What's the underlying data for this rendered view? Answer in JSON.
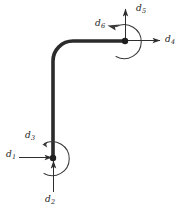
{
  "figure": {
    "background_color": "#ffffff",
    "member_color": "#2b2b2b",
    "annotation_color": "#333333",
    "label_color": "#222222",
    "member_stroke_width": 3.6,
    "annotation_stroke_width": 1.0,
    "node_radius": 3.2
  },
  "geometry": {
    "lower_node": {
      "x": 53,
      "y": 158
    },
    "upper_node": {
      "x": 125,
      "y": 41
    },
    "elbow_corner": {
      "x": 53,
      "y": 41
    },
    "elbow_radius": 20,
    "vertical_segment": {
      "x": 53,
      "y_top": 61,
      "y_bottom": 158
    },
    "horizontal_segment": {
      "y": 41,
      "x_left": 73,
      "x_right": 125
    }
  },
  "labels": {
    "d1": {
      "base": "d",
      "sub": "1",
      "x": 6,
      "y": 154
    },
    "d2": {
      "base": "d",
      "sub": "2",
      "x": 45,
      "y": 197
    },
    "d3": {
      "base": "d",
      "sub": "3",
      "x": 25,
      "y": 135
    },
    "d4": {
      "base": "d",
      "sub": "4",
      "x": 166,
      "y": 38
    },
    "d5": {
      "base": "d",
      "sub": "5",
      "x": 137,
      "y": 6
    },
    "d6": {
      "base": "d",
      "sub": "6",
      "x": 96,
      "y": 22
    }
  },
  "dofs": [
    {
      "id": "d1",
      "label": "d1",
      "node": "lower",
      "type": "translation",
      "direction": "right",
      "description": "horizontal translation at lower node"
    },
    {
      "id": "d2",
      "label": "d2",
      "node": "lower",
      "type": "translation",
      "direction": "up",
      "description": "vertical translation at lower node"
    },
    {
      "id": "d3",
      "label": "d3",
      "node": "lower",
      "type": "rotation",
      "direction": "counterclockwise",
      "description": "rotation at lower node"
    },
    {
      "id": "d4",
      "label": "d4",
      "node": "upper",
      "type": "translation",
      "direction": "right",
      "description": "horizontal translation at upper node"
    },
    {
      "id": "d5",
      "label": "d5",
      "node": "upper",
      "type": "translation",
      "direction": "up",
      "description": "vertical translation at upper node"
    },
    {
      "id": "d6",
      "label": "d6",
      "node": "upper",
      "type": "rotation",
      "direction": "counterclockwise",
      "description": "rotation at upper node"
    }
  ]
}
